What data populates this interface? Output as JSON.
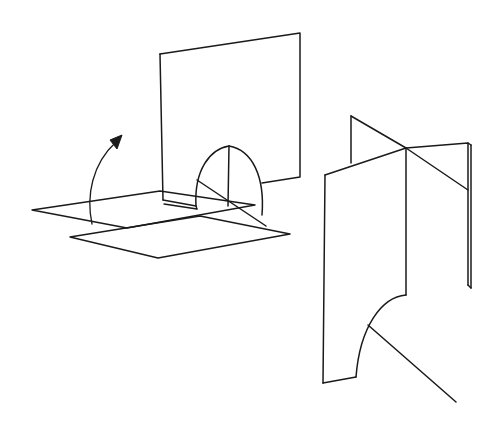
{
  "figure": {
    "background_color": "#ffffff",
    "stroke_color": "#1a1a1a",
    "stroke_width": 1.5,
    "canvas": {
      "width": 493,
      "height": 436
    },
    "panels": [
      {
        "id": "left-panel",
        "name": "unfolded-configuration",
        "description": "Horizontal base plane hinged along a fold line with a vertical plane raised upright, and a parabolic arch flap standing between them. A curved arrow indicates the folding rotation.",
        "elements": [
          {
            "name": "base-plane-far",
            "kind": "quadrilateral",
            "points": "32,210 160,191 255,205 127,228"
          },
          {
            "name": "base-plane-near",
            "kind": "quadrilateral",
            "points": "70,237 200,216 290,234 158,258"
          },
          {
            "name": "fold-seam",
            "kind": "seam-strip",
            "points": "160,191 255,205"
          },
          {
            "name": "vertical-plane",
            "kind": "quadrilateral",
            "points": "160,54 300,33 300,177 163,200"
          },
          {
            "name": "arch-flap",
            "kind": "parabolic-arch",
            "apex": "229,146",
            "left_base": "196,206",
            "right_base": "262,215"
          },
          {
            "name": "arch-apex-rib",
            "kind": "line",
            "points": "229,146 228,205"
          },
          {
            "name": "arch-diagonal-fold",
            "kind": "line",
            "points": "197,180 265,225"
          },
          {
            "name": "rotation-arrow",
            "kind": "curved-arrow",
            "from": "92,224",
            "to": "121,136",
            "direction": "counterclockwise-up"
          }
        ]
      },
      {
        "id": "right-panel",
        "name": "folded-configuration",
        "description": "Two mutually perpendicular vertical planes intersecting along a common vertical edge, with a quarter-circle curved cut in the front-left plane and a diagonal edge running to the lower right.",
        "elements": [
          {
            "name": "back-plane",
            "kind": "quadrilateral",
            "points": "351,116 468,143 468,285 351,258"
          },
          {
            "name": "back-plane-thickness",
            "kind": "line",
            "points": "471,143 471,287"
          },
          {
            "name": "front-plane",
            "kind": "quadrilateral",
            "points": "325,175 406,148 406,390 323,383"
          },
          {
            "name": "intersection-edge",
            "kind": "line",
            "points": "406,148 406,390"
          },
          {
            "name": "upper-left-fin",
            "kind": "triangle",
            "points": "351,116 406,148 351,163"
          },
          {
            "name": "upper-right-fin",
            "kind": "triangle",
            "points": "406,148 468,143 468,190"
          },
          {
            "name": "curve-cut",
            "kind": "quarter-circle",
            "start": "406,295",
            "end": "356,377",
            "sweep": "concave-left"
          },
          {
            "name": "diagonal-edge",
            "kind": "line",
            "points": "368,325 455,400"
          }
        ]
      }
    ]
  }
}
